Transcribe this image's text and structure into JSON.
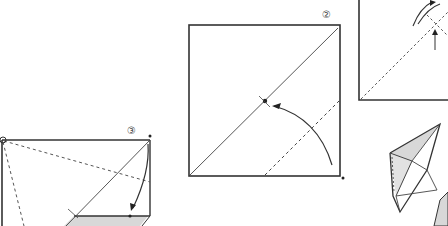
{
  "diagram": {
    "type": "origami-instructions",
    "steps": [
      {
        "number": "②",
        "description": "square with diagonal crease; fold corner to center point"
      },
      {
        "number": "③",
        "description": "folded paper with dashed crease lines; fold top-right corner down"
      }
    ],
    "colors": {
      "line": "#333333",
      "shade": "#d8d8d8",
      "background": "#ffffff"
    }
  }
}
